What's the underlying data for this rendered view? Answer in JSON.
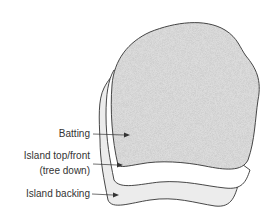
{
  "diagram": {
    "layers": [
      {
        "id": "batting",
        "label": "Batting",
        "fill": "#d9d9d9",
        "texture": "speckled"
      },
      {
        "id": "top_front",
        "label_line1": "Island top/front",
        "label_line2": "(tree down)",
        "fill": "#ffffff"
      },
      {
        "id": "backing",
        "label": "Island backing",
        "fill": "#ececec"
      }
    ],
    "colors": {
      "outline": "#333333",
      "arrow": "#333333",
      "text": "#333333"
    }
  }
}
